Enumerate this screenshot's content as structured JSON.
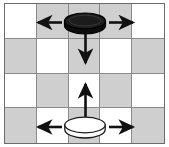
{
  "figure": {
    "description": "A 5-column by 4-row checkerboard with two checker pieces on the centre column; each piece has arrows indicating possible move directions.",
    "type": "board-diagram"
  },
  "board": {
    "columns": 5,
    "rows": 4,
    "light_color": "#ffffff",
    "dark_color": "#cfcfcf",
    "grid_line_color": "#8a8a8a",
    "frame_color": "#6b6b6b",
    "pattern": [
      [
        "light",
        "dark",
        "dark",
        "dark",
        "light"
      ],
      [
        "dark",
        "light",
        "dark",
        "light",
        "dark"
      ],
      [
        "light",
        "dark",
        "light",
        "dark",
        "light"
      ],
      [
        "dark",
        "light",
        "dark",
        "light",
        "dark"
      ]
    ]
  },
  "pieces": [
    {
      "id": "dark-checker",
      "label": "dark checker",
      "color": "#1a1a1a",
      "edge_color": "#000000",
      "row": 1,
      "column": 3,
      "arrows": [
        "left",
        "right",
        "down"
      ]
    },
    {
      "id": "light-checker",
      "label": "light checker",
      "color": "#fdfdfd",
      "edge_color": "#1a1a1a",
      "row": 4,
      "column": 3,
      "arrows": [
        "left",
        "right",
        "up"
      ]
    }
  ],
  "arrows": [
    {
      "id": "dark-left-arrow",
      "piece": "dark-checker",
      "direction": "left",
      "color": "#111111"
    },
    {
      "id": "dark-right-arrow",
      "piece": "dark-checker",
      "direction": "right",
      "color": "#111111"
    },
    {
      "id": "dark-down-arrow",
      "piece": "dark-checker",
      "direction": "down",
      "color": "#111111"
    },
    {
      "id": "light-left-arrow",
      "piece": "light-checker",
      "direction": "left",
      "color": "#111111"
    },
    {
      "id": "light-right-arrow",
      "piece": "light-checker",
      "direction": "right",
      "color": "#111111"
    },
    {
      "id": "light-up-arrow",
      "piece": "light-checker",
      "direction": "up",
      "color": "#111111"
    }
  ]
}
